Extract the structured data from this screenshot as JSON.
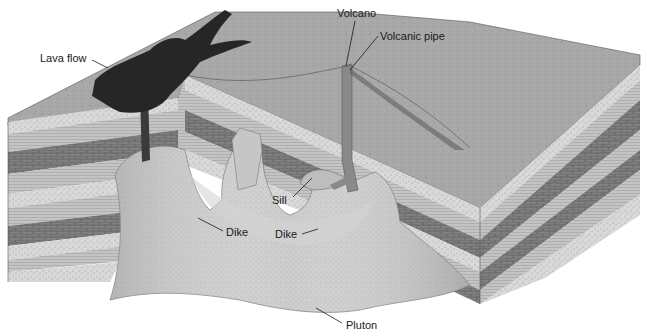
{
  "diagram": {
    "labels": {
      "lava_flow": "Lava flow",
      "volcano": "Volcano",
      "volcanic_pipe": "Volcanic pipe",
      "sill": "Sill",
      "dike_left": "Dike",
      "dike_right": "Dike",
      "pluton": "Pluton"
    },
    "colors": {
      "surface": "#a9a9a9",
      "lava": "#2a2a2a",
      "sandstone": "#d6d6d6",
      "shale": "#bdbdbd",
      "limestone": "#7d7d7d",
      "pluton": "#c8c8c8",
      "pipe": "#8a8a8a",
      "background": "#ffffff"
    }
  }
}
